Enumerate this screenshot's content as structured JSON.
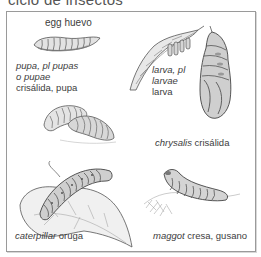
{
  "title": "ciclo de insectos",
  "labels": {
    "egg": {
      "en": "egg",
      "es": "huevo"
    },
    "pupa": {
      "en_line1": "pupa, pl pupas",
      "en_line2": "o pupae",
      "es": "crisálida, pupa"
    },
    "larva": {
      "en_line1": "larva, pl",
      "en_line2": "larvae",
      "es": "larva"
    },
    "chrysalis": {
      "en": "chrysalis",
      "es": "crisálida"
    },
    "caterpillar": {
      "en": "caterpillar",
      "es": "oruga"
    },
    "maggot": {
      "en": "maggot",
      "es": "cresa, gusano"
    }
  },
  "colors": {
    "frame": "#9a9a9a",
    "ink": "#3d3d3d",
    "shade": "#8a8a8a"
  }
}
